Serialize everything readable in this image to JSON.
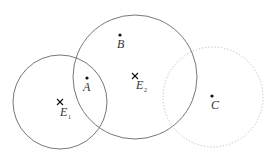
{
  "diagram": {
    "circles": [
      {
        "name": "circle-e1",
        "cx": 60,
        "cy": 102,
        "r": 47,
        "style": "solid",
        "color": "#777777"
      },
      {
        "name": "circle-e2",
        "cx": 135,
        "cy": 77,
        "r": 62,
        "style": "solid",
        "color": "#777777"
      },
      {
        "name": "circle-c",
        "cx": 213,
        "cy": 97,
        "r": 50,
        "style": "dotted",
        "color": "#bbbbbb"
      }
    ],
    "points": [
      {
        "label": "A",
        "x": 87,
        "y": 78
      },
      {
        "label": "B",
        "x": 120,
        "y": 35
      },
      {
        "label": "C",
        "x": 212,
        "y": 96
      }
    ],
    "centers": [
      {
        "label": "E",
        "sub": "1",
        "x": 60,
        "y": 102
      },
      {
        "label": "E",
        "sub": "2",
        "x": 135,
        "y": 76
      }
    ]
  }
}
